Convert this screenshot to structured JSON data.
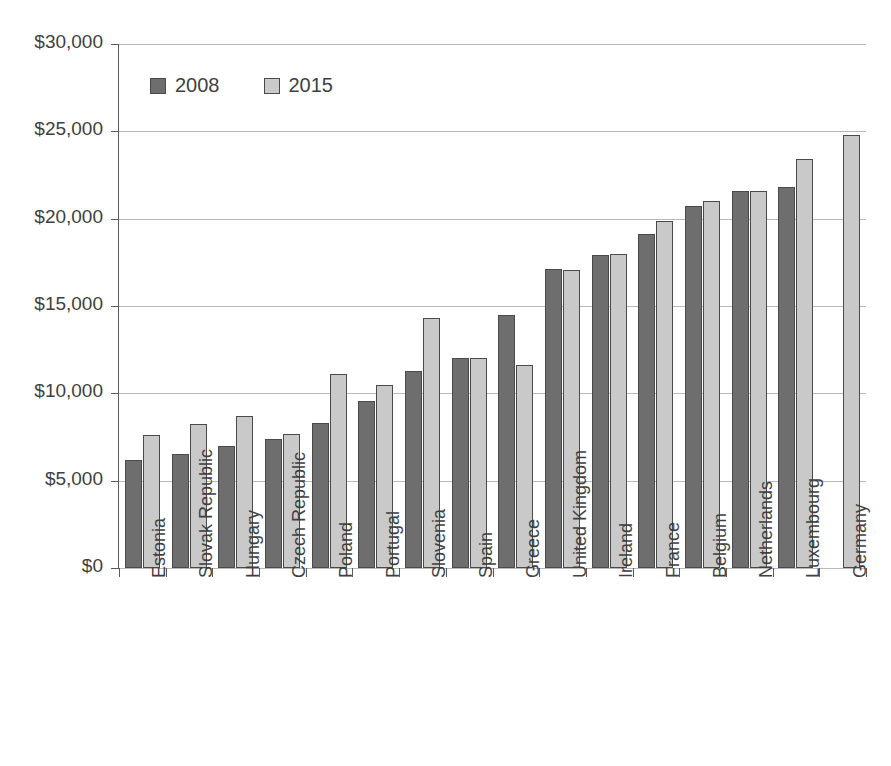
{
  "chart_data": {
    "type": "bar",
    "title": "",
    "subtitle": "",
    "xlabel": "",
    "ylabel": "",
    "ylim": [
      0,
      30000
    ],
    "ytick_values": [
      0,
      5000,
      10000,
      15000,
      20000,
      25000,
      30000
    ],
    "ytick_labels": [
      "$0",
      "$5,000",
      "$10,000",
      "$15,000",
      "$20,000",
      "$25,000",
      "$30,000"
    ],
    "grid": true,
    "legend_position": "top-left-inside",
    "categories": [
      "Estonia",
      "Slovak Republic",
      "Hungary",
      "Czech Republic",
      "Poland",
      "Portugal",
      "Slovenia",
      "Spain",
      "Greece",
      "United Kingdom",
      "Ireland",
      "France",
      "Belgium",
      "Netherlands",
      "Luxembourg",
      "Germany"
    ],
    "series": [
      {
        "name": "2008",
        "color": "#6e6e6e",
        "values": [
          6200,
          6500,
          7000,
          7400,
          8300,
          9550,
          11300,
          12050,
          14500,
          17100,
          17900,
          19150,
          20750,
          21600,
          21800,
          null
        ]
      },
      {
        "name": "2015",
        "color": "#c9c9c9",
        "values": [
          7600,
          8250,
          8700,
          7700,
          11100,
          10500,
          14300,
          12050,
          11650,
          17050,
          18000,
          19850,
          21000,
          21600,
          23400,
          24800
        ]
      }
    ]
  },
  "legend": {
    "items": [
      {
        "label": "2008",
        "color": "#6e6e6e"
      },
      {
        "label": "2015",
        "color": "#c9c9c9"
      }
    ]
  }
}
